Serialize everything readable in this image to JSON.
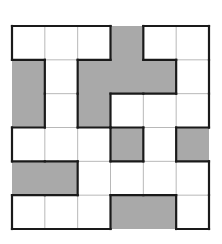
{
  "puzzle": {
    "rows": 6,
    "cols": 6,
    "cell_colors": {
      "white": "#ffffff",
      "gray": "#a9a9a9",
      "thin_line": "#b8b8b8",
      "thick_line": "#1a1a1a"
    },
    "grid": [
      [
        "W",
        "W",
        "W",
        "G",
        "W",
        "W"
      ],
      [
        "G",
        "W",
        "G",
        "G",
        "G",
        "W"
      ],
      [
        "G",
        "W",
        "G",
        "W",
        "W",
        "W"
      ],
      [
        "W",
        "W",
        "W",
        "G",
        "W",
        "G"
      ],
      [
        "G",
        "G",
        "W",
        "W",
        "W",
        "W"
      ],
      [
        "W",
        "W",
        "W",
        "G",
        "G",
        "W"
      ]
    ]
  }
}
